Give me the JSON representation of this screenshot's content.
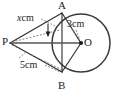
{
  "figure": {
    "name": "circle-with-external-point-tangent-diagram",
    "background_color": "#ffffff",
    "stroke_color": "#2b2b2b",
    "points": {
      "A": {
        "label": "A",
        "x": 62,
        "y": 13
      },
      "B": {
        "label": "B",
        "x": 62,
        "y": 72
      },
      "P": {
        "label": "P",
        "x": 10,
        "y": 43
      },
      "O": {
        "label": "O",
        "x": 81,
        "y": 43
      }
    },
    "circle": {
      "center_x": 81,
      "center_y": 43,
      "radius": 29
    },
    "measurements": [
      {
        "id": "PA",
        "value": "x",
        "unit": "cm",
        "text": "x cm",
        "italic_part": "x",
        "labels_segment": "P-A"
      },
      {
        "id": "OA",
        "value": "3",
        "unit": "cm",
        "text": "3cm",
        "italic_part": "",
        "labels_segment": "A-O"
      },
      {
        "id": "PB",
        "value": "5",
        "unit": "cm",
        "text": "5cm",
        "italic_part": "",
        "labels_segment": "P-B"
      }
    ],
    "segments": [
      {
        "from": "P",
        "to": "A",
        "style": "solid"
      },
      {
        "from": "P",
        "to": "B",
        "style": "solid"
      },
      {
        "from": "A",
        "to": "O",
        "style": "solid"
      },
      {
        "from": "B",
        "to": "O",
        "style": "solid"
      },
      {
        "from": "A",
        "to": "B",
        "style": "solid"
      },
      {
        "from": "P",
        "to": "O",
        "style": "thick"
      },
      {
        "from": "P",
        "to": "A",
        "style": "dashed-construction"
      },
      {
        "from": "P",
        "to": "B",
        "style": "dashed-construction"
      }
    ]
  }
}
